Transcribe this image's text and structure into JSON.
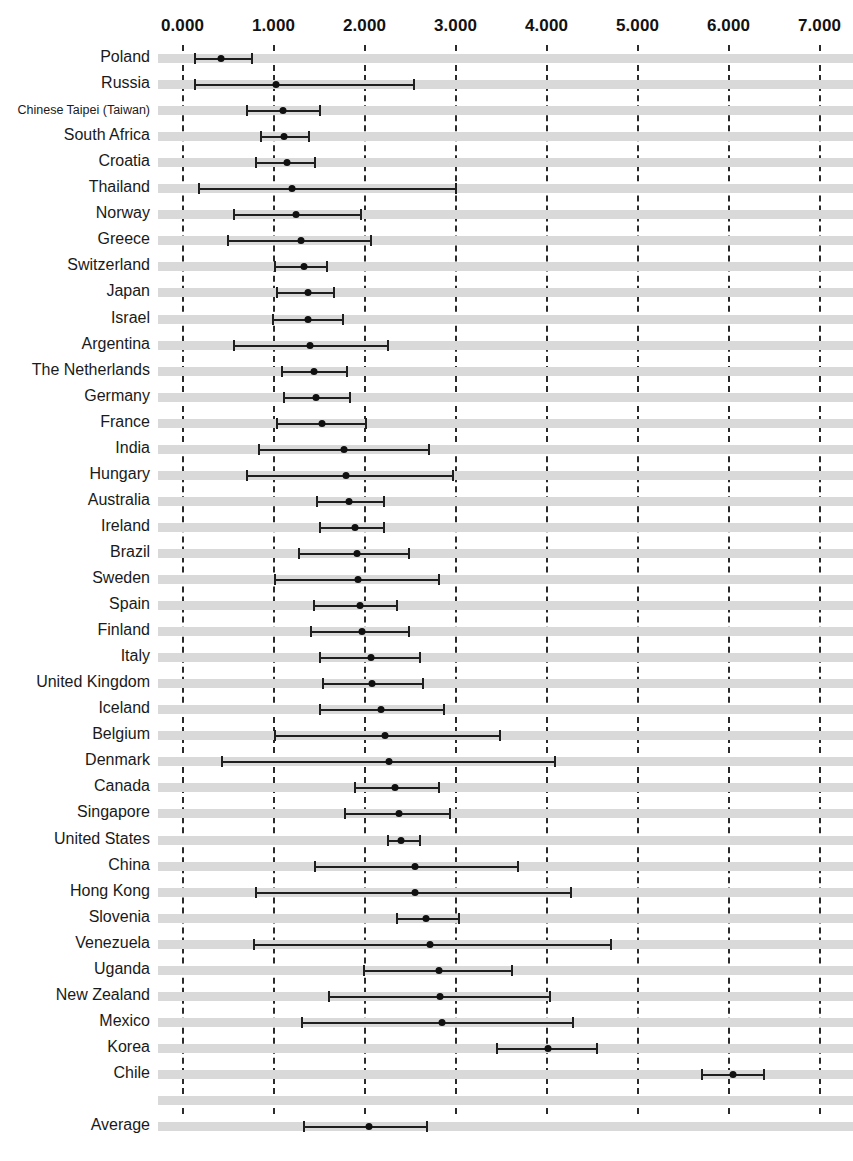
{
  "chart_data": {
    "type": "scatter",
    "subtype": "forest-plot",
    "title": "",
    "xlabel": "",
    "ylabel": "",
    "xlim": [
      -0.1,
      7.35
    ],
    "grid": true,
    "legend": false,
    "axis_ticks": [
      "0.000",
      "1.000",
      "2.000",
      "3.000",
      "4.000",
      "5.000",
      "6.000",
      "7.000"
    ],
    "axis_tick_values": [
      0,
      1,
      2,
      3,
      4,
      5,
      6,
      7
    ],
    "categories": [
      "Poland",
      "Russia",
      "Chinese Taipei (Taiwan)",
      "South Africa",
      "Croatia",
      "Thailand",
      "Norway",
      "Greece",
      "Switzerland",
      "Japan",
      "Israel",
      "Argentina",
      "The Netherlands",
      "Germany",
      "France",
      "India",
      "Hungary",
      "Australia",
      "Ireland",
      "Brazil",
      "Sweden",
      "Spain",
      "Finland",
      "Italy",
      "United Kingdom",
      "Iceland",
      "Belgium",
      "Denmark",
      "Canada",
      "Singapore",
      "United States",
      "China",
      "Hong Kong",
      "Slovenia",
      "Venezuela",
      "Uganda",
      "New Zealand",
      "Mexico",
      "Korea",
      "Chile",
      "",
      "Average"
    ],
    "values": [
      0.42,
      1.03,
      1.1,
      1.12,
      1.15,
      1.2,
      1.25,
      1.3,
      1.33,
      1.38,
      1.38,
      1.4,
      1.45,
      1.47,
      1.53,
      1.78,
      1.8,
      1.83,
      1.9,
      1.92,
      1.93,
      1.95,
      1.97,
      2.07,
      2.08,
      2.18,
      2.23,
      2.27,
      2.33,
      2.38,
      2.4,
      2.55,
      2.55,
      2.68,
      2.72,
      2.82,
      2.83,
      2.85,
      4.02,
      6.05,
      null,
      2.05
    ],
    "ci_low": [
      0.13,
      0.13,
      0.7,
      0.85,
      0.8,
      0.17,
      0.55,
      0.49,
      1.01,
      1.03,
      0.98,
      0.55,
      1.08,
      1.1,
      1.03,
      0.83,
      0.7,
      1.47,
      1.5,
      1.27,
      1.0,
      1.43,
      1.4,
      1.5,
      1.53,
      1.5,
      1.0,
      0.42,
      1.88,
      1.78,
      2.25,
      1.45,
      0.8,
      2.35,
      0.78,
      1.98,
      1.6,
      1.3,
      3.45,
      5.7,
      null,
      1.32
    ],
    "ci_high": [
      0.78,
      2.55,
      1.52,
      1.4,
      1.47,
      3.02,
      1.97,
      2.08,
      1.6,
      1.68,
      1.78,
      2.27,
      1.82,
      1.85,
      2.03,
      2.72,
      2.98,
      2.22,
      2.23,
      2.5,
      2.83,
      2.37,
      2.5,
      2.62,
      2.65,
      2.88,
      3.5,
      4.1,
      2.83,
      2.95,
      2.62,
      3.7,
      4.28,
      3.05,
      4.72,
      3.63,
      4.05,
      4.3,
      4.57,
      6.4,
      null,
      2.7
    ]
  },
  "colors": {
    "band": "#d9d9d9",
    "gridline": "#2b2b2b",
    "marker": "#101010",
    "ci": "#1f1f1f",
    "text": "#1a1a1a",
    "background": "#ffffff"
  }
}
